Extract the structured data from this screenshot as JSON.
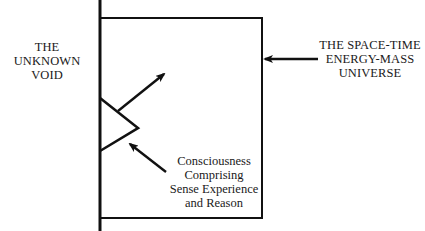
{
  "diagram": {
    "colors": {
      "line": "#111111",
      "background": "#ffffff"
    },
    "left_label": {
      "lines": [
        "THE",
        "UNKNOWN",
        "VOID"
      ]
    },
    "right_label": {
      "lines": [
        "THE SPACE-TIME",
        "ENERGY-MASS",
        "UNIVERSE"
      ]
    },
    "consciousness_label": {
      "lines": [
        "Consciousness",
        "Comprising",
        "Sense Experience",
        "and Reason"
      ]
    },
    "elements": [
      {
        "name": "boundary-line",
        "type": "vertical-line"
      },
      {
        "name": "universe-box",
        "type": "rectangle"
      },
      {
        "name": "consciousness-zigzag",
        "type": "wedge"
      },
      {
        "name": "outward-arrow",
        "type": "arrow"
      },
      {
        "name": "consciousness-pointer-arrow",
        "type": "arrow"
      },
      {
        "name": "universe-pointer-arrow",
        "type": "arrow"
      }
    ]
  }
}
